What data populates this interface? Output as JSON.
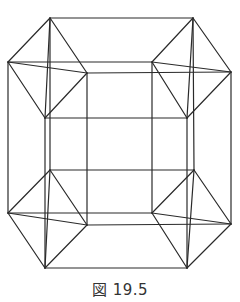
{
  "figure": {
    "caption": "図 19.5",
    "stroke_color": "#2a2a2a",
    "stroke_width": 1.2,
    "clusters": {
      "top_left": {
        "top": [
          50,
          18
        ],
        "left": [
          8,
          62
        ],
        "right": [
          87,
          73
        ],
        "bottom": [
          45,
          118
        ]
      },
      "top_right": {
        "top": [
          193,
          18
        ],
        "left": [
          152,
          62
        ],
        "right": [
          231,
          72
        ],
        "bottom": [
          187,
          118
        ]
      },
      "bottom_left": {
        "top": [
          50,
          170
        ],
        "left": [
          8,
          213
        ],
        "right": [
          87,
          225
        ],
        "bottom": [
          45,
          268
        ]
      },
      "bottom_right": {
        "top": [
          194,
          170
        ],
        "left": [
          152,
          213
        ],
        "right": [
          231,
          224
        ],
        "bottom": [
          187,
          268
        ]
      }
    }
  }
}
